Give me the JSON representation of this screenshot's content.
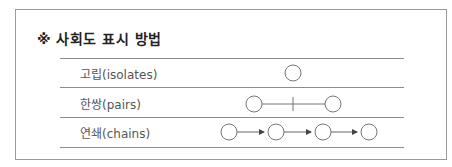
{
  "title": "※ 사회도 표시 방법",
  "rows": [
    {
      "label": "고립(isolates)",
      "symbol": "single-circle"
    },
    {
      "label": "한쌍(pairs)",
      "symbol": "two-circles-connected-with-tick"
    },
    {
      "label": "연쇄(chains)",
      "symbol": "four-circles-with-arrows"
    }
  ],
  "colors": {
    "border": "#9a9a9a",
    "line": "#8c8c8c",
    "stroke": "#777777",
    "text": "#555555"
  }
}
